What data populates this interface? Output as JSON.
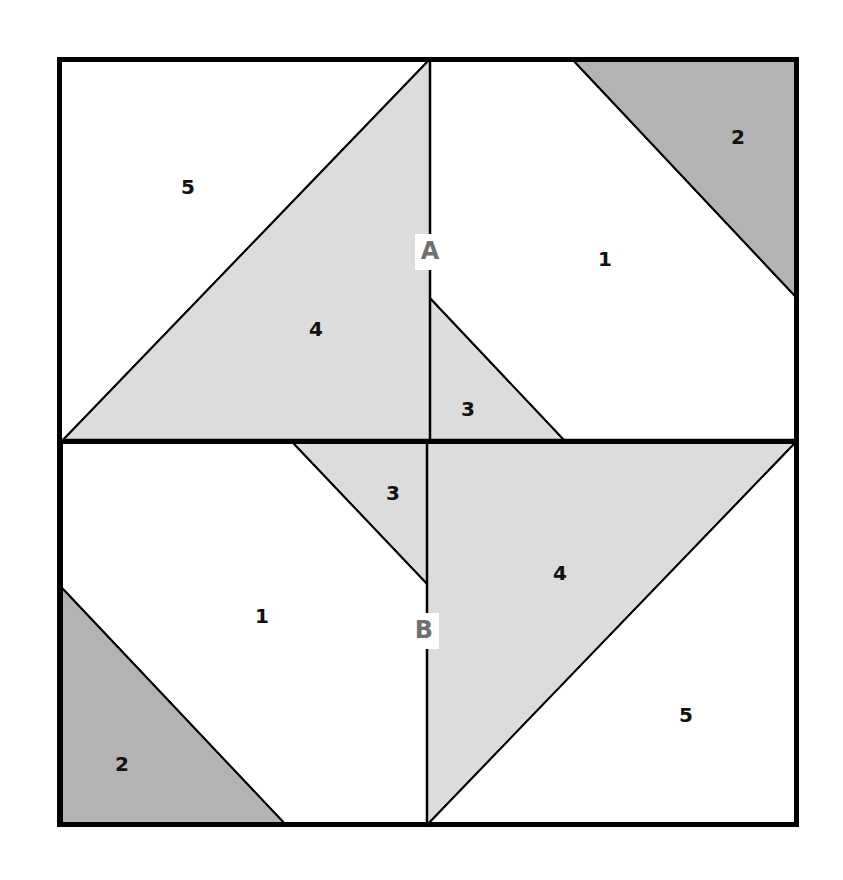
{
  "colors": {
    "background": "#ffffff",
    "light_fill": "#dcdcdc",
    "dark_fill": "#b3b3b3",
    "white_fill": "#ffffff",
    "line": "#000000",
    "seam_label": "#707070"
  },
  "block": {
    "outer": {
      "x": 59,
      "y": 59,
      "w": 738,
      "h": 766
    },
    "midline_y": 441,
    "top_seam_x": 430,
    "bottom_seam_x": 427
  },
  "pieces": [
    {
      "id": "top-5",
      "label": "5",
      "fill": "white",
      "points": "59,59 430,59 62,441 59,441",
      "label_pos": [
        188,
        188
      ]
    },
    {
      "id": "top-4",
      "label": "4",
      "fill": "light",
      "points": "430,59 430,441 62,441",
      "label_pos": [
        316,
        330
      ]
    },
    {
      "id": "top-3",
      "label": "3",
      "fill": "light",
      "points": "430,298 565,441 430,441",
      "label_pos": [
        468,
        410
      ]
    },
    {
      "id": "top-1",
      "label": "1",
      "fill": "white",
      "points": "430,59 572,59 795,296 795,441 565,441 430,298",
      "label_pos": [
        605,
        260
      ]
    },
    {
      "id": "top-2",
      "label": "2",
      "fill": "dark",
      "points": "572,59 795,59 795,296",
      "label_pos": [
        738,
        138
      ]
    },
    {
      "id": "bottom-3",
      "label": "3",
      "fill": "light",
      "points": "293,443 427,443 427,584",
      "label_pos": [
        393,
        494
      ]
    },
    {
      "id": "bottom-1",
      "label": "1",
      "fill": "white",
      "points": "62,443 293,443 427,584 427,825 286,825 62,588",
      "label_pos": [
        262,
        617
      ]
    },
    {
      "id": "bottom-2",
      "label": "2",
      "fill": "dark",
      "points": "62,588 286,825 62,825",
      "label_pos": [
        122,
        765
      ]
    },
    {
      "id": "bottom-4",
      "label": "4",
      "fill": "light",
      "points": "427,443 795,443 427,825",
      "label_pos": [
        560,
        574
      ]
    },
    {
      "id": "bottom-5",
      "label": "5",
      "fill": "white",
      "points": "795,443 795,825 427,825",
      "label_pos": [
        686,
        716
      ]
    }
  ],
  "seam_labels": [
    {
      "id": "A",
      "text": "A",
      "x": 430,
      "y": 252
    },
    {
      "id": "B",
      "text": "B",
      "x": 424,
      "y": 631
    }
  ]
}
